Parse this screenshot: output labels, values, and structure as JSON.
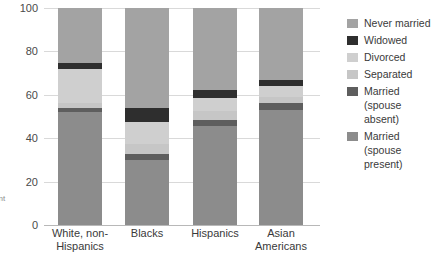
{
  "chart_data": {
    "type": "bar",
    "subtype": "stacked-bar-100-percent",
    "title": "",
    "xlabel": "",
    "ylabel": "",
    "ylim": [
      0,
      100
    ],
    "yticks": [
      0,
      20,
      40,
      60,
      80,
      100
    ],
    "ytick_labels": [
      "0",
      "20",
      "40",
      "60",
      "80",
      "100"
    ],
    "grid": true,
    "legend_position": "right",
    "categories": [
      "White, non-\nHispanics",
      "Blacks",
      "Hispanics",
      "Asian\nAmericans"
    ],
    "series": [
      {
        "name": "Married\n(spouse present)",
        "color": "#8c8c8c",
        "values": [
          52.0,
          30.0,
          45.5,
          53.0
        ]
      },
      {
        "name": "Married\n(spouse absent)",
        "color": "#5e5e5e",
        "values": [
          2.0,
          2.5,
          3.0,
          3.0
        ]
      },
      {
        "name": "Separated",
        "color": "#c6c6c6",
        "values": [
          2.0,
          5.0,
          4.0,
          3.0
        ]
      },
      {
        "name": "Divorced",
        "color": "#cfcfcf",
        "values": [
          16.0,
          10.0,
          6.0,
          5.0
        ]
      },
      {
        "name": "Widowed",
        "color": "#2e2e2e",
        "values": [
          2.5,
          6.5,
          3.5,
          3.0
        ]
      },
      {
        "name": "Never married",
        "color": "#a3a3a3",
        "values": [
          25.5,
          46.0,
          38.0,
          33.0
        ]
      }
    ]
  },
  "legend": {
    "items": [
      {
        "label": "Never married",
        "color": "#a3a3a3"
      },
      {
        "label": "Widowed",
        "color": "#2e2e2e"
      },
      {
        "label": "Divorced",
        "color": "#cfcfcf"
      },
      {
        "label": "Separated",
        "color": "#c6c6c6"
      },
      {
        "label": "Married\n(spouse absent)",
        "color": "#5e5e5e"
      },
      {
        "label": "Married\n(spouse present)",
        "color": "#8c8c8c"
      }
    ]
  },
  "margin_notes": {
    "lines": [
      "s",
      "ent",
      "u"
    ]
  },
  "colors": {
    "gridline": "#d9d9d9",
    "axis": "#b8b8b8",
    "text": "#3a3a3a",
    "background": "#ffffff"
  }
}
